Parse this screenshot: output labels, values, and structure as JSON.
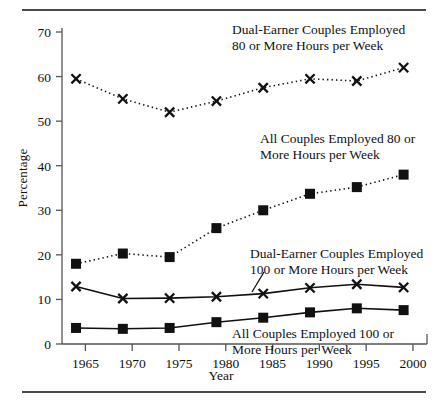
{
  "figure": {
    "rule_top": "horizontal-rule",
    "rule_bottom": "horizontal-rule"
  },
  "chart_data": {
    "type": "line",
    "title": "",
    "xlabel": "Year",
    "ylabel": "Percentage",
    "xlim": [
      1962.5,
      2001.5
    ],
    "ylim": [
      0,
      70
    ],
    "yticks": [
      0,
      10,
      20,
      30,
      40,
      50,
      60,
      70
    ],
    "xticks": [
      1965,
      1970,
      1975,
      1980,
      1985,
      1990,
      1995,
      2000
    ],
    "ytick_labels": [
      "0",
      "10",
      "20",
      "30",
      "40",
      "50",
      "60",
      "70"
    ],
    "xtick_labels": [
      "1965",
      "1970",
      "1975",
      "1980",
      "1985",
      "1990",
      "1995",
      "2000"
    ],
    "grid": false,
    "legend": "inline-annotations",
    "x": [
      1964,
      1969,
      1974,
      1979,
      1984,
      1989,
      1994,
      1999
    ],
    "series": [
      {
        "name": "Dual-Earner Couples Employed 80 or More Hours per Week",
        "marker": "x",
        "linestyle": "dotted",
        "color": "#111111",
        "values": [
          59.5,
          55.0,
          52.0,
          54.5,
          57.5,
          59.5,
          59.0,
          62.0
        ]
      },
      {
        "name": "All Couples Employed 80 or More Hours per Week",
        "marker": "square",
        "linestyle": "dotted",
        "color": "#111111",
        "values": [
          18.0,
          20.3,
          19.5,
          26.0,
          30.0,
          33.7,
          35.2,
          38.0
        ]
      },
      {
        "name": "Dual-Earner Couples Employed 100 or More Hours per Week",
        "marker": "x",
        "linestyle": "solid",
        "color": "#111111",
        "values": [
          12.9,
          10.2,
          10.3,
          10.6,
          11.3,
          12.6,
          13.4,
          12.7
        ]
      },
      {
        "name": "All Couples Employed 100 or More Hours per Week",
        "marker": "square",
        "linestyle": "solid",
        "color": "#111111",
        "values": [
          3.6,
          3.4,
          3.6,
          4.9,
          5.9,
          7.1,
          8.0,
          7.6
        ]
      }
    ],
    "annotations": [
      {
        "id": "de80",
        "line1": "Dual-Earner Couples Employed",
        "line2": "80 or More Hours per Week"
      },
      {
        "id": "all80",
        "line1": "All Couples Employed 80 or",
        "line2": "More Hours per Week"
      },
      {
        "id": "de100",
        "line1": "Dual-Earner Couples Employed",
        "line2": "100 or More Hours per Week"
      },
      {
        "id": "all100",
        "line1": "All Couples Employed 100 or",
        "line2": "More Hours per Week"
      }
    ]
  }
}
